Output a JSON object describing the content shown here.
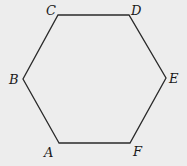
{
  "diagram": {
    "shape": "hexagon",
    "stroke_color": "#2a2a2a",
    "background_color": "#ededed",
    "vertices": [
      {
        "label": "A",
        "x": 59,
        "y": 143,
        "label_x": 44,
        "label_y": 157
      },
      {
        "label": "B",
        "x": 23,
        "y": 79,
        "label_x": 9,
        "label_y": 84
      },
      {
        "label": "C",
        "x": 58,
        "y": 15,
        "label_x": 46,
        "label_y": 15
      },
      {
        "label": "D",
        "x": 129,
        "y": 15,
        "label_x": 131,
        "label_y": 15
      },
      {
        "label": "E",
        "x": 166,
        "y": 78,
        "label_x": 169,
        "label_y": 83
      },
      {
        "label": "F",
        "x": 130,
        "y": 143,
        "label_x": 133,
        "label_y": 156
      }
    ]
  }
}
